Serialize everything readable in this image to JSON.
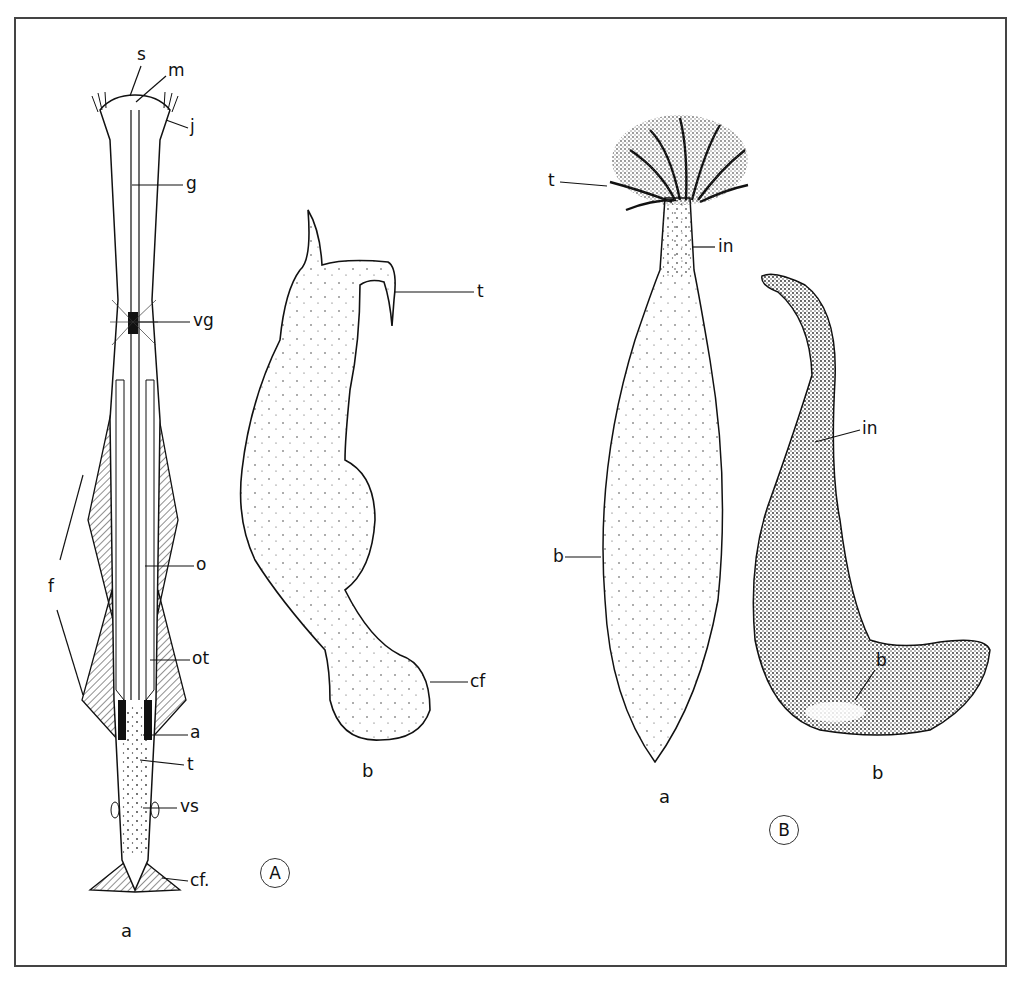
{
  "figure": {
    "panels": [
      {
        "id": "A",
        "circle_label": "A",
        "specimens": [
          {
            "sub_label": "a",
            "labels": [
              "s",
              "m",
              "j",
              "g",
              "vg",
              "f",
              "o",
              "ot",
              "a",
              "t",
              "vs",
              "cf."
            ]
          },
          {
            "sub_label": "b",
            "labels": [
              "t",
              "cf"
            ]
          }
        ]
      },
      {
        "id": "B",
        "circle_label": "B",
        "specimens": [
          {
            "sub_label": "a",
            "labels": [
              "t",
              "in",
              "b"
            ]
          },
          {
            "sub_label": "b",
            "labels": [
              "in",
              "b"
            ]
          }
        ]
      }
    ]
  },
  "colors": {
    "ink": "#111111",
    "frame": "#444444",
    "paper": "#ffffff"
  }
}
